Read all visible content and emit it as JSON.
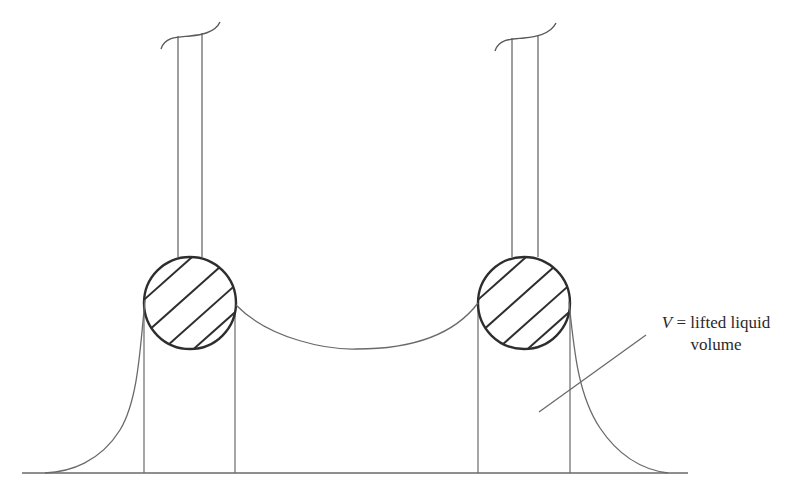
{
  "figure": {
    "type": "two-cylinder liquid bridge diagram",
    "annotation": {
      "variable": "V",
      "equals": " = lifted liquid",
      "line2": "volume"
    },
    "elements": [
      "left-rod",
      "right-rod",
      "left-cylinder-cross-section",
      "right-cylinder-cross-section",
      "meniscus-between-cylinders",
      "outer-left-meniscus",
      "outer-right-meniscus",
      "baseline-liquid-surface",
      "leader-line"
    ],
    "colors": {
      "stroke": "#3a3a3a",
      "thin_stroke": "#6a6a6a",
      "background": "#ffffff"
    }
  }
}
